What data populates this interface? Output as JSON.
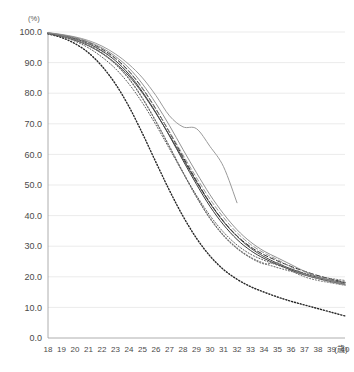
{
  "chart_data": {
    "type": "line",
    "title": "",
    "xlabel": "(歳)",
    "ylabel": "(%)",
    "xlim": [
      18,
      40
    ],
    "ylim": [
      0,
      100
    ],
    "grid": true,
    "legend": "none",
    "x": [
      18,
      19,
      20,
      21,
      22,
      23,
      24,
      25,
      26,
      27,
      28,
      29,
      30,
      31,
      32,
      33,
      34,
      35,
      36,
      37,
      38,
      39,
      40
    ],
    "x_tick_labels": [
      "18",
      "19",
      "20",
      "21",
      "22",
      "23",
      "24",
      "25",
      "26",
      "27",
      "28",
      "29",
      "30",
      "31",
      "32",
      "33",
      "34",
      "35",
      "36",
      "37",
      "38",
      "39",
      "40"
    ],
    "y_tick_labels": [
      "0.0",
      "10.0",
      "20.0",
      "30.0",
      "40.0",
      "50.0",
      "60.0",
      "70.0",
      "80.0",
      "90.0",
      "100.0"
    ],
    "y_tick_values": [
      0,
      10,
      20,
      30,
      40,
      50,
      60,
      70,
      80,
      90,
      100
    ],
    "series": [
      {
        "name": "cohort-a-solid-dark",
        "style": "solid",
        "color": "#3a3a3a",
        "width": 1.0,
        "values": [
          99.6,
          98.9,
          97.8,
          96.2,
          93.8,
          90.6,
          86.2,
          80.4,
          73.6,
          66.0,
          58.0,
          50.2,
          43.0,
          37.0,
          32.2,
          28.6,
          26.0,
          24.0,
          22.2,
          20.6,
          19.4,
          18.4,
          17.6
        ]
      },
      {
        "name": "cohort-b-solid-dark2",
        "style": "solid",
        "color": "#4a4a4a",
        "width": 1.0,
        "values": [
          99.5,
          98.6,
          97.3,
          95.5,
          93.0,
          89.8,
          85.6,
          80.0,
          73.4,
          66.2,
          58.6,
          51.0,
          44.0,
          38.0,
          33.2,
          29.4,
          26.6,
          24.4,
          22.6,
          21.0,
          19.8,
          18.8,
          18.0
        ]
      },
      {
        "name": "cohort-c-dashed",
        "style": "dashed",
        "color": "#2e2e2e",
        "width": 1.0,
        "values": [
          99.7,
          99.0,
          98.0,
          96.6,
          94.4,
          91.4,
          87.2,
          81.6,
          74.8,
          67.2,
          59.2,
          51.4,
          44.2,
          38.2,
          33.4,
          29.8,
          27.2,
          25.2,
          23.4,
          21.8,
          20.4,
          19.2,
          18.2
        ]
      },
      {
        "name": "cohort-d-dotted-light",
        "style": "dotted",
        "color": "#777777",
        "width": 1.1,
        "values": [
          99.6,
          98.8,
          97.6,
          95.8,
          93.2,
          89.6,
          84.8,
          78.4,
          70.8,
          62.6,
          54.2,
          46.2,
          39.2,
          33.6,
          29.4,
          26.4,
          24.4,
          23.0,
          21.8,
          20.6,
          19.6,
          18.8,
          18.2
        ]
      },
      {
        "name": "cohort-e-dotted-bold",
        "style": "dotted",
        "color": "#262626",
        "width": 1.4,
        "values": [
          99.4,
          98.2,
          96.2,
          93.2,
          88.8,
          83.0,
          75.6,
          66.8,
          57.4,
          48.2,
          39.8,
          32.6,
          26.8,
          22.4,
          19.2,
          16.8,
          15.0,
          13.4,
          12.0,
          10.8,
          9.6,
          8.4,
          7.2
        ]
      },
      {
        "name": "cohort-f-solid-gray-plateau",
        "style": "solid",
        "color": "#9a9a9a",
        "width": 1.0,
        "values": [
          99.8,
          99.2,
          98.4,
          97.2,
          95.4,
          92.8,
          89.4,
          85.0,
          79.2,
          72.6,
          69.0,
          68.4,
          62.6,
          56.0,
          44.2,
          null,
          null,
          null,
          null,
          null,
          null,
          null,
          null
        ]
      },
      {
        "name": "cohort-g-dashed-gray",
        "style": "dashed",
        "color": "#8a8a8a",
        "width": 0.9,
        "values": [
          99.6,
          98.9,
          97.9,
          96.4,
          94.2,
          91.2,
          87.0,
          81.4,
          74.6,
          67.4,
          59.8,
          52.4,
          45.4,
          39.4,
          34.4,
          30.6,
          27.8,
          25.6,
          23.2,
          21.0,
          19.4,
          18.2,
          17.4
        ]
      },
      {
        "name": "cohort-h-dotted-mid",
        "style": "dotted",
        "color": "#5c5c5c",
        "width": 1.0,
        "values": [
          99.5,
          98.5,
          97.0,
          94.8,
          91.8,
          88.0,
          83.0,
          76.8,
          69.6,
          61.8,
          54.0,
          46.6,
          40.0,
          34.6,
          30.4,
          27.4,
          25.4,
          23.8,
          22.4,
          21.2,
          20.2,
          19.4,
          18.8
        ]
      },
      {
        "name": "cohort-i-solid-gray-late",
        "style": "solid",
        "color": "#868686",
        "width": 0.9,
        "values": [
          99.7,
          99.1,
          98.2,
          96.8,
          94.8,
          92.0,
          88.2,
          83.0,
          76.6,
          69.4,
          61.6,
          54.0,
          46.8,
          40.6,
          35.4,
          31.4,
          28.4,
          26.2,
          24.0,
          21.8,
          20.0,
          18.6,
          17.4
        ]
      },
      {
        "name": "cohort-j-dotted-tail",
        "style": "dotted",
        "color": "#6e6e6e",
        "width": 1.0,
        "values": [
          99.4,
          98.6,
          97.4,
          95.6,
          93.0,
          89.4,
          84.6,
          78.2,
          70.6,
          62.4,
          54.0,
          46.0,
          39.0,
          33.4,
          29.2,
          26.2,
          24.2,
          24.6,
          22.0,
          20.0,
          18.8,
          18.0,
          17.2
        ]
      }
    ]
  },
  "axes": {
    "y_unit": "(%)",
    "x_unit": "(歳)"
  }
}
